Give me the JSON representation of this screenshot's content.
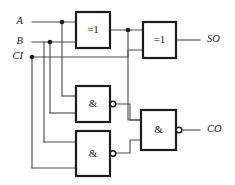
{
  "diagram": {
    "colors": {
      "background": "#ffffff",
      "wire": "#4a4a4a",
      "gate_outline": "#1a1a1a",
      "text": "#1a1a1a"
    }
  },
  "inputs": [
    {
      "id": "A",
      "label": "A",
      "x": 28,
      "y": 22
    },
    {
      "id": "B",
      "label": "B",
      "x": 28,
      "y": 42
    },
    {
      "id": "CI",
      "label": "CI",
      "x": 28,
      "y": 57
    }
  ],
  "outputs": [
    {
      "id": "SO",
      "label": "SO",
      "x": 205,
      "y": 40
    },
    {
      "id": "CO",
      "label": "CO",
      "x": 205,
      "y": 130
    }
  ],
  "gates": [
    {
      "id": "xor1",
      "type": "xor",
      "label": "=1",
      "x": 76,
      "y": 12,
      "w": 34,
      "h": 36,
      "inverted": false
    },
    {
      "id": "xor2",
      "type": "xor",
      "label": "=1",
      "x": 143,
      "y": 22,
      "w": 33,
      "h": 36,
      "inverted": false
    },
    {
      "id": "nand1",
      "type": "nand",
      "label": "&",
      "x": 76,
      "y": 86,
      "w": 34,
      "h": 36,
      "inverted": true
    },
    {
      "id": "nand2",
      "type": "nand",
      "label": "&",
      "x": 76,
      "y": 131,
      "w": 34,
      "h": 45,
      "inverted": true
    },
    {
      "id": "nand3",
      "type": "nand",
      "label": "&",
      "x": 141,
      "y": 110,
      "w": 35,
      "h": 40,
      "inverted": true
    }
  ],
  "junctions": [
    {
      "id": "j-a",
      "x": 62,
      "y": 22
    },
    {
      "id": "j-b",
      "x": 50,
      "y": 42
    },
    {
      "id": "j-ci",
      "x": 32,
      "y": 57
    },
    {
      "id": "j-xor1",
      "x": 128,
      "y": 30
    }
  ],
  "wires": [
    {
      "id": "w-a-main",
      "d": "M 32 22 L 76 22"
    },
    {
      "id": "w-b-main",
      "d": "M 32 42 L 76 42"
    },
    {
      "id": "w-ci-main",
      "d": "M 32 57 L 128 57 L 128 50 L 143 50"
    },
    {
      "id": "w-a-down",
      "d": "M 62 22 L 62 96"
    },
    {
      "id": "w-a-nand1",
      "d": "M 62 96 L 76 96"
    },
    {
      "id": "w-b-down",
      "d": "M 50 42 L 50 113"
    },
    {
      "id": "w-b-nand1",
      "d": "M 50 113 L 76 113"
    },
    {
      "id": "w-b-down2",
      "d": "M 44 42 L 44 142"
    },
    {
      "id": "w-b-nand2",
      "d": "M 44 142 L 76 142"
    },
    {
      "id": "w-ci-down",
      "d": "M 32 57 L 32 168"
    },
    {
      "id": "w-ci-nand2",
      "d": "M 32 168 L 76 168"
    },
    {
      "id": "w-xor1-out",
      "d": "M 110 30 L 143 30"
    },
    {
      "id": "w-xor1-drop",
      "d": "M 128 30 L 128 120 L 141 120"
    },
    {
      "id": "w-xor2-out",
      "d": "M 176 40 L 200 40"
    },
    {
      "id": "w-nand1-out",
      "d": "M 116 104 L 130 104 L 130 120 L 141 120"
    },
    {
      "id": "w-nand2-out",
      "d": "M 116 153 L 130 153 L 130 140 L 141 140"
    },
    {
      "id": "w-nand3-out",
      "d": "M 182 130 L 200 130"
    }
  ]
}
